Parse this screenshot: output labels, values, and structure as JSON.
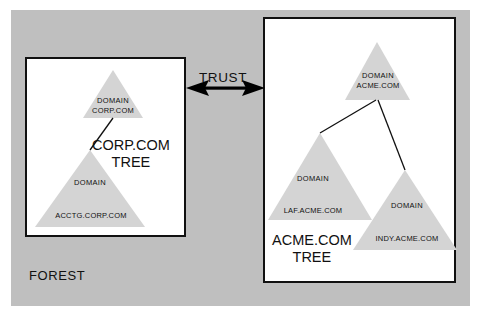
{
  "diagram": {
    "forest_label": "FOREST",
    "trust_label": "TRUST",
    "colors": {
      "forest_background": "#bfbfbf",
      "box_background": "#ffffff",
      "box_border": "#111111",
      "triangle_fill": "#d4d4d4",
      "text": "#111111",
      "arrow": "#000000"
    },
    "trees": [
      {
        "id": "corp-tree",
        "caption_line1": "CORP.COM",
        "caption_line2": "TREE",
        "nodes": [
          {
            "id": "corp-root",
            "kind": "DOMAIN",
            "name": "CORP.COM"
          },
          {
            "id": "acctg",
            "kind": "DOMAIN",
            "name": "ACCTG.CORP.COM"
          }
        ]
      },
      {
        "id": "acme-tree",
        "caption_line1": "ACME.COM",
        "caption_line2": "TREE",
        "nodes": [
          {
            "id": "acme-root",
            "kind": "DOMAIN",
            "name": "ACME.COM"
          },
          {
            "id": "laf",
            "kind": "DOMAIN",
            "name": "LAF.ACME.COM"
          },
          {
            "id": "indy",
            "kind": "DOMAIN",
            "name": "INDY.ACME.COM"
          }
        ]
      }
    ]
  }
}
